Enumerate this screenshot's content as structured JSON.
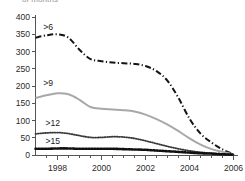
{
  "figure": {
    "clipped_header": "of months",
    "width": 245,
    "height": 181
  },
  "chart_data": {
    "type": "line",
    "title": "",
    "subtitle": "",
    "xlabel": "",
    "ylabel": "",
    "xlim": [
      1997,
      2006.2
    ],
    "ylim": [
      0,
      400
    ],
    "yticks": [
      0,
      50,
      100,
      150,
      200,
      250,
      300,
      350,
      400
    ],
    "ytick_labels": [
      "0",
      "50",
      "100",
      "150",
      "200",
      "250",
      "300",
      "350",
      "400"
    ],
    "xticks": [
      1998,
      2000,
      2002,
      2004,
      2006
    ],
    "xtick_labels": [
      "1998",
      "2000",
      "2002",
      "2004",
      "2006"
    ],
    "x_minor_tick_interval": 0.5,
    "grid": false,
    "legend": "inline-labels",
    "x": [
      1997.0,
      1997.5,
      1998.0,
      1998.5,
      1999.0,
      1999.5,
      2000.0,
      2000.5,
      2001.0,
      2001.5,
      2002.0,
      2002.5,
      2003.0,
      2003.5,
      2004.0,
      2004.5,
      2005.0,
      2005.5,
      2006.0
    ],
    "series": [
      {
        "name": ">6",
        "label": ">6",
        "style": "dash-dot",
        "color": "#141414",
        "width": 2.0,
        "label_x": 1997.35,
        "label_y": 372,
        "values": [
          340,
          347,
          350,
          340,
          305,
          278,
          272,
          268,
          266,
          264,
          258,
          243,
          215,
          165,
          105,
          62,
          36,
          16,
          2
        ]
      },
      {
        "name": ">9",
        "label": ">9",
        "style": "solid",
        "color": "#a8a8a8",
        "width": 2.0,
        "label_x": 1997.35,
        "label_y": 210,
        "values": [
          165,
          173,
          179,
          176,
          160,
          139,
          134,
          132,
          130,
          126,
          117,
          104,
          88,
          69,
          48,
          30,
          17,
          9,
          2
        ]
      },
      {
        "name": ">12",
        "label": ">12",
        "style": "fine-dotted",
        "color": "#3a3a3a",
        "width": 1.8,
        "label_x": 1997.45,
        "label_y": 92,
        "values": [
          61,
          64,
          65,
          62,
          56,
          51,
          51,
          53,
          52,
          48,
          41,
          33,
          25,
          18,
          12,
          8,
          5,
          3,
          1
        ]
      },
      {
        "name": ">15",
        "label": ">15",
        "style": "bold-dotted",
        "color": "#101010",
        "width": 2.6,
        "label_x": 1997.45,
        "label_y": 40,
        "values": [
          18,
          18,
          19,
          19,
          18,
          18,
          18,
          18,
          17,
          16,
          15,
          13,
          11,
          9,
          7,
          5,
          4,
          2,
          1
        ]
      }
    ]
  }
}
